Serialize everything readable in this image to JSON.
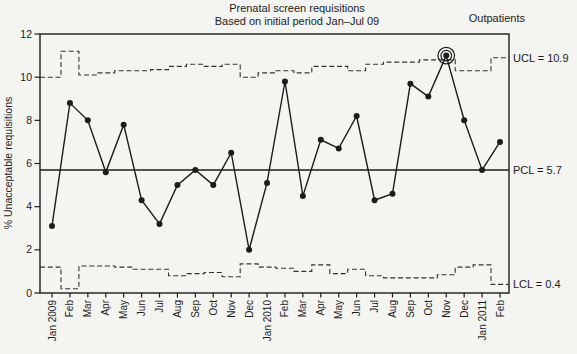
{
  "header": {
    "title_line1": "Prenatal screen requisitions",
    "title_line2": "Based on initial period Jan–Jul 09",
    "corner_label": "Outpatients"
  },
  "annotations": {
    "ucl_label": "UCL = 10.9",
    "pcl_label": "PCL = 5.7",
    "lcl_label": "LCL = 0.4"
  },
  "chart_data": {
    "type": "line",
    "subtype": "spc-control-chart",
    "title": "Prenatal screen requisitions",
    "subtitle": "Based on initial period Jan–Jul 09",
    "ylabel": "% Unacceptable requisitions",
    "xlabel": "",
    "ylim": [
      0,
      12
    ],
    "y_ticks": [
      0,
      2,
      4,
      6,
      8,
      10,
      12
    ],
    "grid": false,
    "legend": "none",
    "categories": [
      "Jan 2009",
      "Feb",
      "Mar",
      "Apr",
      "May",
      "Jun",
      "Jul",
      "Aug",
      "Sep",
      "Oct",
      "Nov",
      "Dec",
      "Jan 2010",
      "Feb",
      "Mar",
      "Apr",
      "May",
      "Jun",
      "Jul",
      "Aug",
      "Sep",
      "Oct",
      "Nov",
      "Dec",
      "Jan 2011",
      "Feb"
    ],
    "series": [
      {
        "name": "% unacceptable requisitions",
        "style": "line-markers",
        "values": [
          3.1,
          8.8,
          8.0,
          5.6,
          7.8,
          4.3,
          3.2,
          5.0,
          5.7,
          5.0,
          6.5,
          2.0,
          5.1,
          9.8,
          4.5,
          7.1,
          6.7,
          8.2,
          4.3,
          4.6,
          9.7,
          9.1,
          11.0,
          8.0,
          5.7,
          7.0
        ]
      },
      {
        "name": "UCL (stepped monthly limit)",
        "style": "step-dashed",
        "values": [
          10.0,
          11.2,
          10.1,
          10.2,
          10.3,
          10.3,
          10.35,
          10.5,
          10.6,
          10.5,
          10.6,
          10.0,
          10.2,
          10.3,
          10.2,
          10.5,
          10.5,
          10.3,
          10.6,
          10.7,
          10.7,
          10.8,
          10.8,
          10.3,
          10.3,
          10.9
        ]
      },
      {
        "name": "LCL (stepped monthly limit)",
        "style": "step-dashed",
        "values": [
          1.2,
          0.2,
          1.25,
          1.25,
          1.2,
          1.1,
          1.1,
          0.8,
          0.9,
          0.95,
          0.75,
          1.35,
          1.2,
          1.15,
          1.0,
          1.3,
          0.9,
          1.1,
          0.8,
          0.7,
          0.7,
          0.7,
          0.85,
          1.2,
          1.3,
          0.4
        ]
      },
      {
        "name": "PCL (centre line)",
        "style": "solid-hline",
        "value": 5.7
      }
    ],
    "control_limits": {
      "UCL": 10.9,
      "PCL": 5.7,
      "LCL": 0.4
    },
    "special_cause": {
      "index": 22,
      "category": "Nov",
      "value": 11.0,
      "marker": "double-circle"
    }
  },
  "colors": {
    "ink": "#1c1c1c",
    "dashed_limit": "#333333",
    "background": "#f4f4f1"
  }
}
